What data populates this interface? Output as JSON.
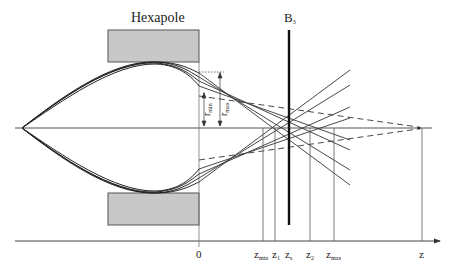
{
  "diagram": {
    "title_hexapole": "Hexapole",
    "title_b3_main": "B",
    "title_b3_sub": "3",
    "radius_labels": {
      "rmin_main": "r",
      "rmin_sub": "min",
      "rmax_main": "r",
      "rmax_sub": "max"
    },
    "axis": {
      "origin_label": "0",
      "z_label": "z",
      "ticks": [
        {
          "main": "z",
          "sub": "min"
        },
        {
          "main": "z",
          "sub": "1"
        },
        {
          "main": "z",
          "sub": "s"
        },
        {
          "main": "z",
          "sub": "2"
        },
        {
          "main": "z",
          "sub": "max"
        }
      ]
    },
    "colors": {
      "line": "#333333",
      "magnet_fill": "#c8c8c8",
      "magnet_stroke": "#555555"
    }
  }
}
